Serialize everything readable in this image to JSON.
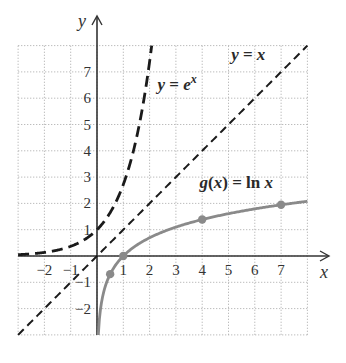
{
  "chart_data": {
    "type": "line",
    "title": "",
    "xlabel": "x",
    "ylabel": "y",
    "xlim": [
      -3,
      8
    ],
    "ylim": [
      -3,
      8
    ],
    "grid": true,
    "grid_style": "dotted",
    "x_ticks": [
      "-2",
      "-1",
      "1",
      "2",
      "3",
      "4",
      "5",
      "6",
      "7"
    ],
    "y_ticks": [
      "-2",
      "-1",
      "1",
      "2",
      "3",
      "4",
      "5",
      "6",
      "7"
    ],
    "x_tick_values": [
      -2,
      -1,
      1,
      2,
      3,
      4,
      5,
      6,
      7
    ],
    "y_tick_values": [
      -2,
      -1,
      1,
      2,
      3,
      4,
      5,
      6,
      7
    ],
    "series": [
      {
        "name": "y = e^x",
        "label_main": "y = e",
        "label_sup": "x",
        "function": "exp",
        "style": "long-dash",
        "color": "#1a1a1a",
        "domain": [
          -3,
          2.08
        ],
        "label_pos": [
          2.3,
          6.3
        ]
      },
      {
        "name": "y = x",
        "label_main": "y = x",
        "function": "identity",
        "style": "dashed",
        "color": "#1a1a1a",
        "domain": [
          -3,
          8
        ],
        "label_pos": [
          5.1,
          7.45
        ]
      },
      {
        "name": "g(x) = ln x",
        "label_main": "g(x) = ln x",
        "function": "ln",
        "style": "solid",
        "color": "#8a8a8a",
        "domain": [
          0.05,
          8
        ],
        "label_pos": [
          3.9,
          2.6
        ],
        "points": [
          {
            "x": 0.5,
            "y": -0.69
          },
          {
            "x": 1,
            "y": 0
          },
          {
            "x": 4,
            "y": 1.39
          },
          {
            "x": 7,
            "y": 1.95
          }
        ]
      }
    ]
  }
}
